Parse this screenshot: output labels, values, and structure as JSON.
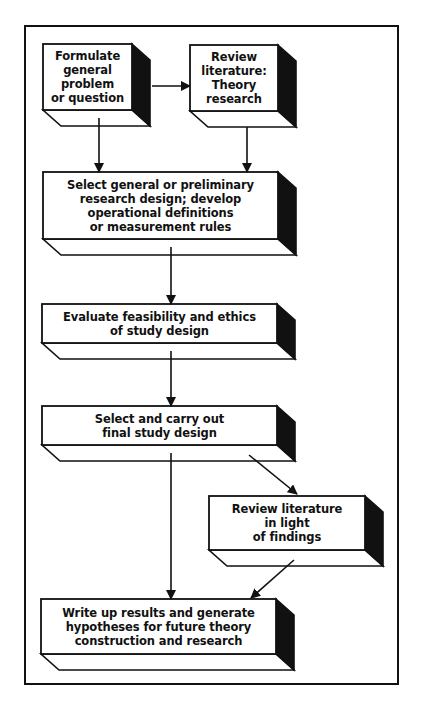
{
  "diagram": {
    "colors": {
      "stroke": "#111111",
      "face": "#ffffff",
      "side": "#111111"
    },
    "nodes": [
      {
        "id": "formulate",
        "label": "Formulate\ngeneral\nproblem\nor question",
        "x": 43,
        "y": 44,
        "w": 89,
        "h": 66
      },
      {
        "id": "review-theory",
        "label": "Review\nliterature:\nTheory\nresearch",
        "x": 190,
        "y": 45,
        "w": 88,
        "h": 66
      },
      {
        "id": "select-design",
        "label": "Select general or preliminary\nresearch design; develop\noperational definitions\nor measurement rules",
        "x": 43,
        "y": 172,
        "w": 235,
        "h": 67
      },
      {
        "id": "evaluate",
        "label": "Evaluate feasibility and ethics\nof study design",
        "x": 42,
        "y": 304,
        "w": 235,
        "h": 39
      },
      {
        "id": "carry-out",
        "label": "Select and carry out\nfinal study design",
        "x": 42,
        "y": 406,
        "w": 235,
        "h": 39
      },
      {
        "id": "review-findings",
        "label": "Review literature\nin light\nof findings",
        "x": 209,
        "y": 496,
        "w": 156,
        "h": 54
      },
      {
        "id": "write-up",
        "label": "Write up results and generate\nhypotheses for future theory\nconstruction and research",
        "x": 41,
        "y": 599,
        "w": 235,
        "h": 55
      }
    ],
    "edges": [
      {
        "from": "formulate",
        "to": "review-theory",
        "x1": 152,
        "y1": 86,
        "x2": 190,
        "y2": 86
      },
      {
        "from": "formulate",
        "to": "select-design",
        "x1": 99,
        "y1": 118,
        "x2": 99,
        "y2": 172
      },
      {
        "from": "review-theory",
        "to": "select-design",
        "x1": 247,
        "y1": 127,
        "x2": 247,
        "y2": 172
      },
      {
        "from": "select-design",
        "to": "evaluate",
        "x1": 171,
        "y1": 247,
        "x2": 171,
        "y2": 304
      },
      {
        "from": "evaluate",
        "to": "carry-out",
        "x1": 171,
        "y1": 351,
        "x2": 171,
        "y2": 406
      },
      {
        "from": "carry-out",
        "to": "review-findings",
        "x1": 249,
        "y1": 455,
        "x2": 297,
        "y2": 494
      },
      {
        "from": "carry-out",
        "to": "write-up",
        "x1": 171,
        "y1": 453,
        "x2": 171,
        "y2": 599
      },
      {
        "from": "review-findings",
        "to": "write-up",
        "x1": 294,
        "y1": 560,
        "x2": 251,
        "y2": 598
      }
    ],
    "depth": {
      "dx": 18,
      "dy": 16
    }
  }
}
